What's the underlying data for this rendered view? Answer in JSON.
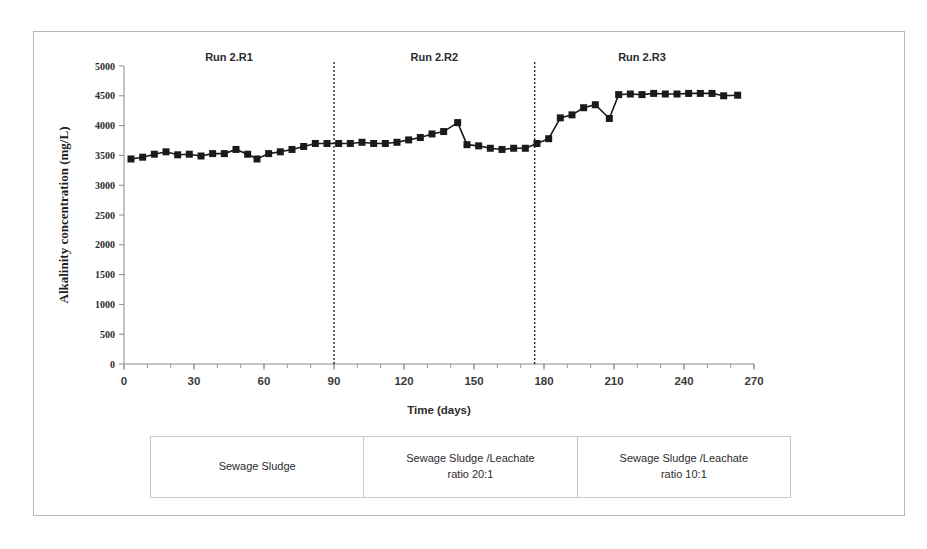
{
  "figure": {
    "background_color": "#ffffff",
    "frame_border_color": "#b8b8b8"
  },
  "chart_data": {
    "type": "line",
    "title": "",
    "xlabel": "Time (days)",
    "ylabel": "Alkalinity concentration (mg/L)",
    "xlim": [
      0,
      270
    ],
    "ylim": [
      0,
      5000
    ],
    "grid": false,
    "legend_position": "none",
    "marker": "square",
    "series_color": "#1a1a1a",
    "x_ticks": [
      0,
      30,
      60,
      90,
      120,
      150,
      180,
      210,
      240,
      270
    ],
    "x_tick_labels": [
      "0",
      "30",
      "60",
      "90",
      "120",
      "150",
      "180",
      "210",
      "240",
      "270"
    ],
    "x_minor_tick_step": 10,
    "y_ticks": [
      0,
      500,
      1000,
      1500,
      2000,
      2500,
      3000,
      3500,
      4000,
      4500,
      5000
    ],
    "y_tick_labels": [
      "0",
      "500",
      "1000",
      "1500",
      "2000",
      "2500",
      "3000",
      "3500",
      "4000",
      "4500",
      "5000"
    ],
    "series": [
      {
        "name": "Alkalinity concentration",
        "x": [
          3,
          8,
          13,
          18,
          23,
          28,
          33,
          38,
          43,
          48,
          53,
          57,
          62,
          67,
          72,
          77,
          82,
          87,
          92,
          97,
          102,
          107,
          112,
          117,
          122,
          127,
          132,
          137,
          143,
          147,
          152,
          157,
          162,
          167,
          172,
          177,
          182,
          187,
          192,
          197,
          202,
          208,
          212,
          217,
          222,
          227,
          232,
          237,
          242,
          247,
          252,
          257,
          263
        ],
        "values": [
          3440,
          3470,
          3520,
          3560,
          3510,
          3520,
          3490,
          3530,
          3530,
          3600,
          3520,
          3440,
          3530,
          3560,
          3600,
          3650,
          3700,
          3700,
          3700,
          3700,
          3720,
          3700,
          3700,
          3720,
          3760,
          3800,
          3860,
          3900,
          4050,
          3680,
          3660,
          3620,
          3600,
          3620,
          3620,
          3700,
          3780,
          4130,
          4180,
          4300,
          4350,
          4120,
          4520,
          4530,
          4520,
          4540,
          4530,
          4530,
          4540,
          4540,
          4540,
          4500,
          4510
        ]
      }
    ],
    "phase_dividers": [
      90,
      176
    ],
    "phase_labels": [
      {
        "label": "Run 2.R1",
        "center_x": 45
      },
      {
        "label": "Run 2.R2",
        "center_x": 133
      },
      {
        "label": "Run 2.R3",
        "center_x": 222
      }
    ]
  },
  "caption_table": {
    "columns": [
      {
        "line1": "Sewage Sludge",
        "line2": ""
      },
      {
        "line1": "Sewage Sludge /Leachate",
        "line2": "ratio 20:1"
      },
      {
        "line1": "Sewage Sludge /Leachate",
        "line2": "ratio 10:1"
      }
    ]
  }
}
